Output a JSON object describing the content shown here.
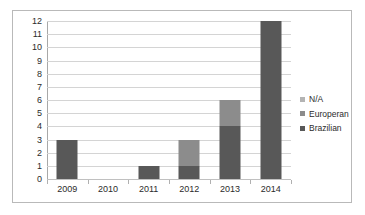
{
  "chart_data": {
    "type": "bar",
    "subtype": "stacked-bar",
    "title": "",
    "subtitle": "",
    "xlabel": "",
    "ylabel": "",
    "categories": [
      "2009",
      "2010",
      "2011",
      "2012",
      "2013",
      "2014"
    ],
    "series": [
      {
        "name": "Brazilian",
        "color": "#585858",
        "values": [
          3,
          0,
          1,
          1,
          4,
          12
        ]
      },
      {
        "name": "Europeran",
        "color": "#8c8c8c",
        "values": [
          0,
          0,
          0,
          2,
          2,
          0
        ]
      },
      {
        "name": "N/A",
        "color": "#b4b4b4",
        "values": [
          0,
          0,
          0,
          0,
          0,
          0
        ]
      }
    ],
    "totals": [
      3,
      0,
      1,
      3,
      6,
      12
    ],
    "ylim": [
      0,
      12
    ],
    "ytick_step": 1,
    "yticks": [
      "12",
      "11",
      "10",
      "9",
      "8",
      "7",
      "6",
      "5",
      "4",
      "3",
      "2",
      "1",
      "0"
    ],
    "grid": {
      "horizontal": true,
      "vertical": false
    },
    "legend": {
      "position": "right",
      "entries": [
        {
          "label": "N/A",
          "color": "#b4b4b4"
        },
        {
          "label": "Europeran",
          "color": "#8c8c8c"
        },
        {
          "label": "Brazilian",
          "color": "#585858"
        }
      ]
    },
    "colors": {
      "plot_background": "#ffffff",
      "gridline": "#d4d4d4",
      "axis_line": "#a8a8a8",
      "border": "#b9b9b9",
      "text": "#2b2b2b"
    }
  }
}
